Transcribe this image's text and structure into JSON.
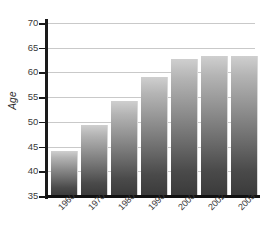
{
  "chart_data": {
    "type": "bar",
    "title": "",
    "subtitle": "",
    "xlabel": "",
    "ylabel": "Age",
    "categories": [
      "1960",
      "1970",
      "1980",
      "1990",
      "2000",
      "2002",
      "2003"
    ],
    "values": [
      44.2,
      49.3,
      54.2,
      59.0,
      62.7,
      63.4,
      63.3
    ],
    "ylim": [
      35,
      70
    ],
    "yticks": [
      "35",
      "40",
      "45",
      "50",
      "55",
      "60",
      "65",
      "70"
    ],
    "ytick_values": [
      35,
      40,
      45,
      50,
      55,
      60,
      65,
      70
    ],
    "grid": true,
    "legend": false,
    "legend_position": "none",
    "series": [
      {
        "name": "Age",
        "values": [
          44.2,
          49.3,
          54.2,
          59.0,
          62.7,
          63.4,
          63.3
        ]
      }
    ],
    "colors": {
      "bar_top": "#cfcfcf",
      "bar_bottom": "#3a3a3a",
      "gridline": "#c9c9c9",
      "axis": "#111111",
      "text": "#3a3a3a",
      "background": "#ffffff"
    }
  }
}
